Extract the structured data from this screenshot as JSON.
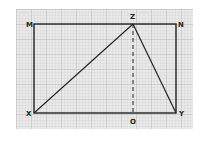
{
  "diagram": {
    "type": "geometry-figure",
    "colors": {
      "grid_background": "#e9e9e9",
      "grid_minor": "#c9c9c9",
      "grid_major": "#aaaaaa",
      "line": "#222222"
    },
    "points": {
      "M": {
        "label": "M",
        "x": 34,
        "y": 24
      },
      "N": {
        "label": "N",
        "x": 176,
        "y": 24
      },
      "X": {
        "label": "X",
        "x": 34,
        "y": 113
      },
      "Y": {
        "label": "Y",
        "x": 176,
        "y": 113
      },
      "Z": {
        "label": "Z",
        "x": 133,
        "y": 24
      },
      "O": {
        "label": "O",
        "x": 133,
        "y": 113
      }
    },
    "segments": [
      {
        "from": "M",
        "to": "N",
        "style": "solid"
      },
      {
        "from": "N",
        "to": "Y",
        "style": "solid"
      },
      {
        "from": "Y",
        "to": "X",
        "style": "solid"
      },
      {
        "from": "X",
        "to": "M",
        "style": "solid"
      },
      {
        "from": "X",
        "to": "Z",
        "style": "solid"
      },
      {
        "from": "Z",
        "to": "Y",
        "style": "solid"
      },
      {
        "from": "Z",
        "to": "O",
        "style": "dashed"
      }
    ]
  }
}
